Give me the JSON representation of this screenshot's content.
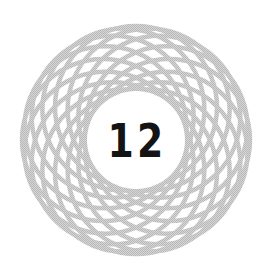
{
  "emblem": {
    "number": "12",
    "icon": "spirograph-rosette-icon",
    "colors": {
      "background": "#ffffff",
      "pattern_stroke": "#c4c4c4",
      "number": "#141414"
    },
    "pattern": {
      "center_x": 136,
      "center_y": 140,
      "circle_count": 16,
      "circle_radius": 81,
      "ring_offset": 33,
      "stroke_width": 4.5
    }
  }
}
